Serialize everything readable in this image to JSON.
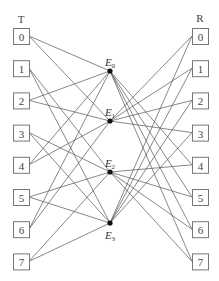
{
  "diagram": {
    "left_column": {
      "label": "T",
      "boxes": [
        "0",
        "1",
        "2",
        "3",
        "4",
        "5",
        "6",
        "7"
      ]
    },
    "right_column": {
      "label": "R",
      "boxes": [
        "0",
        "1",
        "2",
        "3",
        "4",
        "5",
        "6",
        "7"
      ]
    },
    "nodes": [
      {
        "id": "E0",
        "label": "E",
        "sub": "0",
        "label_pos": "above"
      },
      {
        "id": "E1",
        "label": "E",
        "sub": "1",
        "label_pos": "above"
      },
      {
        "id": "E2",
        "label": "E",
        "sub": "2",
        "label_pos": "above"
      },
      {
        "id": "E3",
        "label": "E",
        "sub": "3",
        "label_pos": "below"
      }
    ],
    "edges_left": [
      [
        "T0",
        "E0"
      ],
      [
        "T0",
        "E1"
      ],
      [
        "T1",
        "E2"
      ],
      [
        "T1",
        "E3"
      ],
      [
        "T2",
        "E0"
      ],
      [
        "T2",
        "E1"
      ],
      [
        "T3",
        "E2"
      ],
      [
        "T3",
        "E3"
      ],
      [
        "T4",
        "E0"
      ],
      [
        "T4",
        "E1"
      ],
      [
        "T5",
        "E2"
      ],
      [
        "T5",
        "E3"
      ],
      [
        "T6",
        "E0"
      ],
      [
        "T6",
        "E1"
      ],
      [
        "T7",
        "E2"
      ],
      [
        "T7",
        "E3"
      ]
    ],
    "edges_right": [
      [
        "E0",
        "R4"
      ],
      [
        "E0",
        "R5"
      ],
      [
        "E0",
        "R6"
      ],
      [
        "E0",
        "R7"
      ],
      [
        "E1",
        "R0"
      ],
      [
        "E1",
        "R1"
      ],
      [
        "E1",
        "R2"
      ],
      [
        "E1",
        "R3"
      ],
      [
        "E2",
        "R4"
      ],
      [
        "E2",
        "R5"
      ],
      [
        "E2",
        "R6"
      ],
      [
        "E2",
        "R7"
      ],
      [
        "E3",
        "R0"
      ],
      [
        "E3",
        "R1"
      ],
      [
        "E3",
        "R2"
      ],
      [
        "E3",
        "R3"
      ]
    ]
  }
}
